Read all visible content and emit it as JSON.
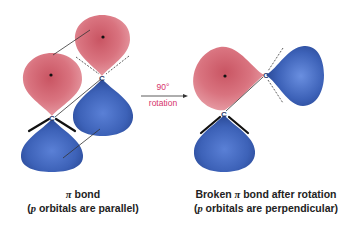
{
  "colors": {
    "red_lobe": "#d9737f",
    "red_lobe_dark": "#b94a58",
    "blue_lobe": "#4a6fc4",
    "blue_lobe_dark": "#2a4a9a",
    "arrow_label": "#d6336c",
    "caption": "#222222",
    "bond": "#1a1a1a"
  },
  "left_panel": {
    "atom_labels": [
      "C",
      "C"
    ],
    "caption_line1_symbol": "π",
    "caption_line1_text": " bond",
    "caption_line2_prefix": "(",
    "caption_line2_italic": "p",
    "caption_line2_text": " orbitals are parallel)"
  },
  "arrow": {
    "angle_label": "90°",
    "label": "rotation"
  },
  "right_panel": {
    "atom_labels": [
      "C",
      "C"
    ],
    "caption_line1_prefix": "Broken ",
    "caption_line1_symbol": "π",
    "caption_line1_text": " bond after rotation",
    "caption_line2_prefix": "(",
    "caption_line2_italic": "p",
    "caption_line2_text": " orbitals are perpendicular)"
  }
}
